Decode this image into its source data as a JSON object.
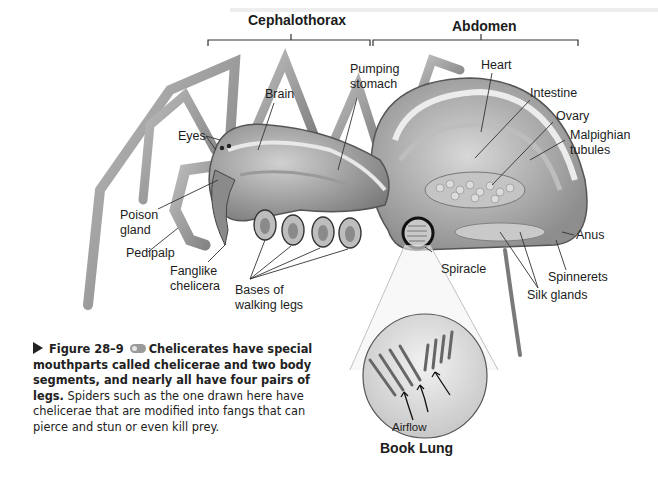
{
  "headers": {
    "cephalothorax": "Cephalothorax",
    "abdomen": "Abdomen"
  },
  "labels": {
    "brain": "Brain",
    "pumping_stomach": "Pumping\nstomach",
    "heart": "Heart",
    "intestine": "Intestine",
    "ovary": "Ovary",
    "malpighian_tubules": "Malpighian\ntubules",
    "eyes": "Eyes",
    "poison_gland": "Poison\ngland",
    "pedipalp": "Pedipalp",
    "fanglike_chelicera": "Fanglike\nchelicera",
    "bases_of_walking_legs": "Bases of\nwalking legs",
    "spiracle": "Spiracle",
    "anus": "Anus",
    "spinnerets": "Spinnerets",
    "silk_glands": "Silk glands"
  },
  "inset": {
    "airflow": "Airflow",
    "title": "Book Lung"
  },
  "caption": {
    "figure_number": "Figure 28–9",
    "icon": "online-resource-icon",
    "bold_text": "Chelicerates have special mouthparts called chelicerae and two body segments, and nearly all have four pairs of legs.",
    "body_text": "Spiders such as the one drawn here have chelicerae that are modified into fangs that can pierce and stun or even kill prey."
  },
  "colors": {
    "line": "#222222",
    "body_fill": "#a8a8a8",
    "body_light": "#d4d4d4",
    "background": "#ffffff"
  }
}
